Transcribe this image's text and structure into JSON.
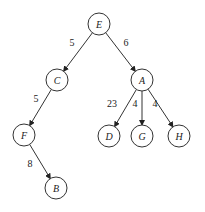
{
  "diagram": {
    "type": "tree",
    "directed": true,
    "nodes": [
      {
        "id": "E",
        "label": "E",
        "x": 99,
        "y": 24
      },
      {
        "id": "C",
        "label": "C",
        "x": 57,
        "y": 80
      },
      {
        "id": "A",
        "label": "A",
        "x": 142,
        "y": 80
      },
      {
        "id": "F",
        "label": "F",
        "x": 24,
        "y": 135
      },
      {
        "id": "D",
        "label": "D",
        "x": 109,
        "y": 136
      },
      {
        "id": "G",
        "label": "G",
        "x": 142,
        "y": 136
      },
      {
        "id": "H",
        "label": "H",
        "x": 179,
        "y": 136
      },
      {
        "id": "B",
        "label": "B",
        "x": 56,
        "y": 188
      }
    ],
    "edges": [
      {
        "from": "E",
        "to": "C",
        "weight": "5",
        "lx": 72,
        "ly": 46
      },
      {
        "from": "E",
        "to": "A",
        "weight": "6",
        "lx": 126,
        "ly": 46
      },
      {
        "from": "C",
        "to": "F",
        "weight": "5",
        "lx": 36,
        "ly": 102
      },
      {
        "from": "A",
        "to": "D",
        "weight": "23",
        "lx": 112,
        "ly": 107
      },
      {
        "from": "A",
        "to": "G",
        "weight": "4",
        "lx": 135,
        "ly": 107
      },
      {
        "from": "A",
        "to": "H",
        "weight": "4",
        "lx": 155,
        "ly": 107
      },
      {
        "from": "F",
        "to": "B",
        "weight": "8",
        "lx": 30,
        "ly": 167
      }
    ]
  }
}
